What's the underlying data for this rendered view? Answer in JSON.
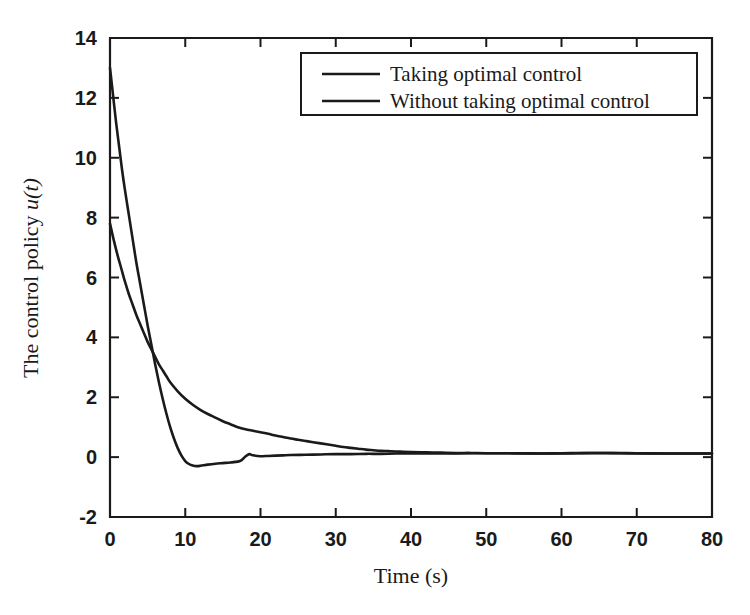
{
  "chart_data": {
    "type": "line",
    "title": "",
    "xlabel": "Time (s)",
    "ylabel_prefix": "The control policy ",
    "ylabel_math": "u(t)",
    "ylabel": "The control policy u(t)",
    "xlim": [
      0,
      80
    ],
    "ylim": [
      -2,
      14
    ],
    "xticks": [
      0,
      10,
      20,
      30,
      40,
      50,
      60,
      70,
      80
    ],
    "xtick_labels": [
      "0",
      "10",
      "20",
      "30",
      "40",
      "50",
      "60",
      "70",
      "80"
    ],
    "yticks": [
      -2,
      0,
      2,
      4,
      6,
      8,
      10,
      12,
      14
    ],
    "ytick_labels": [
      "-2",
      "0",
      "2",
      "4",
      "6",
      "8",
      "10",
      "12",
      "14"
    ],
    "grid": false,
    "legend_position": "top-center-right",
    "line_color": "#1a1a1a",
    "series": [
      {
        "name": "Taking optimal control",
        "x": [
          0,
          0.5,
          1,
          1.5,
          2,
          2.5,
          3,
          3.5,
          4,
          4.5,
          5,
          5.5,
          6,
          6.5,
          7,
          7.5,
          8,
          9,
          10,
          11,
          12,
          13,
          14,
          15,
          16,
          17,
          18,
          19,
          20,
          21,
          22,
          23,
          24,
          25,
          26,
          27,
          28,
          29,
          30,
          31,
          32,
          33,
          34,
          35,
          36,
          37,
          38,
          40,
          42,
          44,
          46,
          48,
          50,
          54,
          58,
          62,
          66,
          70,
          74,
          78,
          80
        ],
        "y": [
          7.8,
          7.25,
          6.75,
          6.3,
          5.85,
          5.45,
          5.1,
          4.75,
          4.45,
          4.15,
          3.85,
          3.6,
          3.35,
          3.1,
          2.9,
          2.7,
          2.5,
          2.2,
          1.95,
          1.75,
          1.58,
          1.44,
          1.32,
          1.2,
          1.1,
          1.0,
          0.93,
          0.88,
          0.83,
          0.78,
          0.72,
          0.67,
          0.62,
          0.58,
          0.54,
          0.5,
          0.46,
          0.42,
          0.38,
          0.34,
          0.31,
          0.28,
          0.25,
          0.23,
          0.21,
          0.2,
          0.19,
          0.17,
          0.16,
          0.15,
          0.14,
          0.14,
          0.13,
          0.13,
          0.12,
          0.13,
          0.14,
          0.13,
          0.12,
          0.12,
          0.12
        ]
      },
      {
        "name": "Without taking optimal control",
        "x": [
          0,
          0.4,
          0.8,
          1.2,
          1.6,
          2,
          2.5,
          3,
          3.5,
          4,
          4.5,
          5,
          5.5,
          6,
          6.5,
          7,
          7.5,
          8,
          8.5,
          9,
          9.5,
          10,
          10.5,
          11,
          11.5,
          12,
          13,
          14,
          15,
          16,
          17,
          17.5,
          18,
          18.5,
          19,
          20,
          21,
          22,
          23,
          24,
          26,
          28,
          30,
          32,
          34,
          36,
          38,
          40,
          44,
          48,
          52,
          56,
          60,
          64,
          68,
          72,
          76,
          80
        ],
        "y": [
          13.0,
          12.1,
          11.2,
          10.4,
          9.6,
          8.9,
          8.1,
          7.3,
          6.5,
          5.8,
          5.1,
          4.4,
          3.75,
          3.1,
          2.5,
          1.95,
          1.45,
          1.0,
          0.62,
          0.3,
          0.05,
          -0.13,
          -0.23,
          -0.28,
          -0.3,
          -0.29,
          -0.25,
          -0.22,
          -0.2,
          -0.18,
          -0.15,
          -0.1,
          0.02,
          0.1,
          0.06,
          0.03,
          0.04,
          0.05,
          0.06,
          0.07,
          0.08,
          0.09,
          0.1,
          0.1,
          0.11,
          0.11,
          0.12,
          0.12,
          0.12,
          0.13,
          0.13,
          0.12,
          0.13,
          0.14,
          0.13,
          0.12,
          0.12,
          0.12
        ]
      }
    ]
  },
  "legend": {
    "entries": [
      {
        "label": "Taking optimal control"
      },
      {
        "label": "Without taking optimal control"
      }
    ]
  }
}
